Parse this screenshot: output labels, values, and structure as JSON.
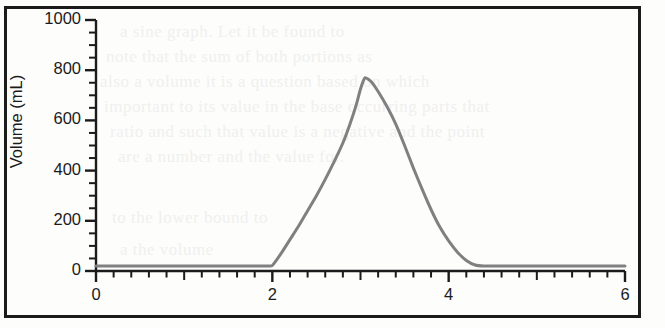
{
  "figure": {
    "credit": "© Cengage Learning 2013",
    "background_color": "#fdfdfc",
    "border_color": "#1b1b1b"
  },
  "bleed_through_lines": [
    "a sine graph. Let it be found to",
    "note that the sum of both portions as",
    "also a volume it is a question based on which",
    "important to its value in the base occurring parts that",
    "ratio and such that value is a negative and the point",
    "are a number and the value for.",
    "to the lower bound to",
    "a the volume"
  ],
  "chart_data": {
    "type": "line",
    "title": "",
    "xlabel": "",
    "ylabel": "Volume (mL)",
    "xlim": [
      0,
      6
    ],
    "ylim": [
      0,
      1000
    ],
    "grid": false,
    "legend": null,
    "line_color": "#808080",
    "line_width": 3,
    "axis_color": "#1b1b1b",
    "x_ticks_major": [
      0,
      2,
      4,
      6
    ],
    "x_tick_labels": [
      "0",
      "2",
      "4",
      "6"
    ],
    "x_tick_minor_step": 0.2,
    "y_ticks_major": [
      0,
      200,
      400,
      600,
      800,
      1000
    ],
    "y_tick_labels": [
      "0",
      "200",
      "400",
      "600",
      "800",
      "1000"
    ],
    "y_tick_minor_step": 50,
    "peak": {
      "x": 3.05,
      "y": 770
    },
    "baseline_value": 20,
    "rise_start_x": 2.0,
    "return_to_baseline_x": 4.3,
    "series": [
      {
        "name": "Volume",
        "points": [
          [
            0.0,
            20
          ],
          [
            0.2,
            20
          ],
          [
            0.4,
            20
          ],
          [
            0.6,
            20
          ],
          [
            0.8,
            20
          ],
          [
            1.0,
            20
          ],
          [
            1.2,
            20
          ],
          [
            1.4,
            20
          ],
          [
            1.6,
            20
          ],
          [
            1.8,
            20
          ],
          [
            1.95,
            20
          ],
          [
            2.0,
            22
          ],
          [
            2.1,
            70
          ],
          [
            2.2,
            125
          ],
          [
            2.3,
            180
          ],
          [
            2.4,
            240
          ],
          [
            2.5,
            300
          ],
          [
            2.6,
            365
          ],
          [
            2.7,
            435
          ],
          [
            2.8,
            510
          ],
          [
            2.88,
            585
          ],
          [
            2.95,
            660
          ],
          [
            3.0,
            725
          ],
          [
            3.05,
            770
          ],
          [
            3.12,
            755
          ],
          [
            3.2,
            715
          ],
          [
            3.3,
            655
          ],
          [
            3.4,
            585
          ],
          [
            3.5,
            500
          ],
          [
            3.6,
            410
          ],
          [
            3.7,
            325
          ],
          [
            3.8,
            245
          ],
          [
            3.9,
            175
          ],
          [
            4.0,
            120
          ],
          [
            4.1,
            75
          ],
          [
            4.2,
            42
          ],
          [
            4.3,
            24
          ],
          [
            4.4,
            20
          ],
          [
            4.6,
            20
          ],
          [
            4.8,
            20
          ],
          [
            5.0,
            20
          ],
          [
            5.2,
            20
          ],
          [
            5.4,
            20
          ],
          [
            5.6,
            20
          ],
          [
            5.8,
            20
          ],
          [
            6.0,
            20
          ]
        ]
      }
    ]
  }
}
